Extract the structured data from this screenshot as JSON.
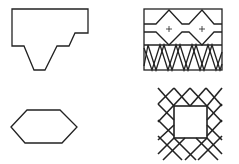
{
  "figure": {
    "stroke_color": "#222222",
    "background": "#ffffff",
    "shapes": [
      {
        "id": "notched-polygon",
        "label": "Irregular polygon with stepped V-notch bottom"
      },
      {
        "id": "patterned-rectangle",
        "label": "Rectangle with zigzag bands, two plus marks and cross-hatched lower band"
      },
      {
        "id": "hexagon",
        "label": "Elongated hexagon"
      },
      {
        "id": "lattice-square",
        "label": "Diagonal lattice surrounding an open square"
      }
    ],
    "marks": {
      "plus": "+"
    }
  }
}
